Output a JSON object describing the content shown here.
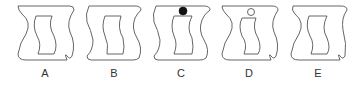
{
  "colors": {
    "stroke": "#555555",
    "background": "#ffffff",
    "dot_filled": "#111111",
    "dot_empty": "#ffffff"
  },
  "figures": [
    {
      "label": "A",
      "variant": "outer-left-wave, inner-left-offset",
      "dot": "none"
    },
    {
      "label": "B",
      "variant": "outer-symmetric-s, inner-s",
      "dot": "none"
    },
    {
      "label": "C",
      "variant": "outer-symmetric-s, inner-s",
      "dot": "filled"
    },
    {
      "label": "D",
      "variant": "outer-left-wave, inner-narrow",
      "dot": "hollow"
    },
    {
      "label": "E",
      "variant": "outer-left-wave, inner-s",
      "dot": "none"
    }
  ]
}
